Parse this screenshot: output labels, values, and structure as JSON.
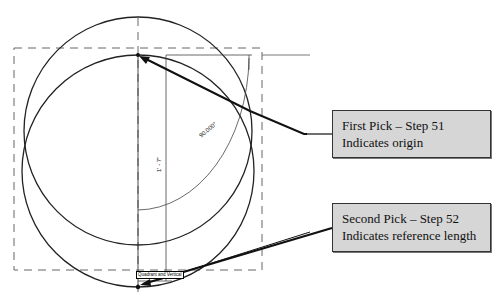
{
  "diagram": {
    "callouts": [
      {
        "title": "First Pick – Step 51",
        "description": "Indicates origin"
      },
      {
        "title": "Second Pick – Step 52",
        "description": "Indicates reference length"
      }
    ],
    "dimensions": {
      "angle": "90.000°",
      "length": "1' - 7\""
    },
    "snap_tooltip": "Quadrant and Vertical",
    "colors": {
      "line": "#222222",
      "dashed": "#666666",
      "callout_fill": "#d6d6d6",
      "callout_border": "#333333"
    }
  }
}
